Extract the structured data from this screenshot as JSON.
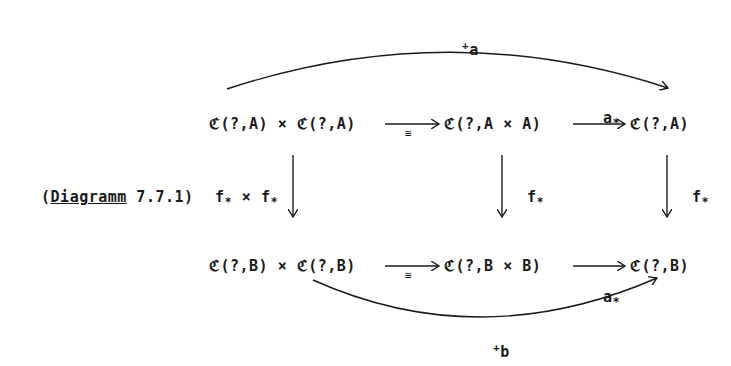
{
  "diagram": {
    "caption_prefix": "(",
    "caption_word": "Diagramm",
    "caption_number": " 7.7.1)",
    "top_row": {
      "left": "ℭ(?,A) × ℭ(?,A)",
      "middle": "ℭ(?,A × A)",
      "right": "ℭ(?,A)"
    },
    "bottom_row": {
      "left": "ℭ(?,B) × ℭ(?,B)",
      "middle": "ℭ(?,B × B)",
      "right": "ℭ(?,B)"
    },
    "arrows": {
      "top_iso": "≅",
      "top_a_star_base": "a",
      "top_a_star_sub": "*",
      "top_arc_sup": "+",
      "top_arc_base": "a",
      "left_vertical_f1": "f",
      "left_vertical_f1_sub": "*",
      "left_vertical_times": " × ",
      "left_vertical_f2": "f",
      "left_vertical_f2_sub": "*",
      "middle_vertical_base": "f",
      "middle_vertical_sub": "*",
      "right_vertical_base": "f",
      "right_vertical_sub": "*",
      "bottom_iso": "≅",
      "bottom_a_star_base": "a",
      "bottom_a_star_sub": "*",
      "bottom_arc_sup": "+",
      "bottom_arc_base": "b"
    }
  }
}
